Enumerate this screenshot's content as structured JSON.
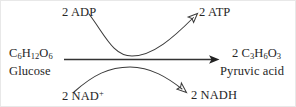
{
  "diagram": {
    "stroke_color": "#333333",
    "text_color": "#262626",
    "background_color": "#ffffff",
    "substrate": {
      "formula_prefix": "C",
      "formula": "C6H12O6",
      "formula_parts": {
        "c": "C",
        "c_sub": "6",
        "h": "H",
        "h_sub": "12",
        "o": "O",
        "o_sub": "6"
      },
      "name": "Glucose"
    },
    "product": {
      "coefficient": "2",
      "formula": "C3H6O3",
      "formula_parts": {
        "coef": "2 ",
        "c": "C",
        "c_sub": "3",
        "h": "H",
        "h_sub": "6",
        "o": "O",
        "o_sub": "3"
      },
      "name": "Pyruvic acid"
    },
    "inputs": [
      {
        "id": "adp",
        "label": "2 ADP",
        "position": "top-left"
      },
      {
        "id": "nad",
        "label_text": "2 NAD",
        "label_sup": "+",
        "label": "2 NAD+",
        "position": "bottom-left"
      }
    ],
    "outputs": [
      {
        "id": "atp",
        "label": "2 ATP",
        "position": "top-right",
        "arrowhead": "open"
      },
      {
        "id": "nadh",
        "label": "2 NADH",
        "position": "bottom-right",
        "arrowhead": "open"
      }
    ],
    "main_arrow": {
      "from": "C6H12O6",
      "to": "2 C3H6O3",
      "arrowhead": "solid"
    }
  }
}
